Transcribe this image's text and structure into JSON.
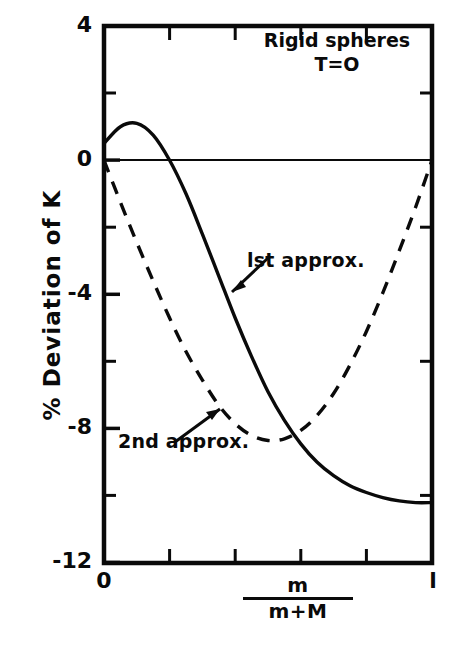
{
  "figure": {
    "background": "#ffffff",
    "ink_color": "#0a0a0a"
  },
  "annotations": {
    "note_line1": "Rigid spheres",
    "note_line2": "T=O",
    "first_approx_label": "lst approx.",
    "second_approx_label": "2nd approx."
  },
  "axes": {
    "ylabel": "% Deviation of K",
    "xlabel_numerator": "m",
    "xlabel_denominator": "m+M",
    "y_tick_labels": [
      "4",
      "0",
      "-4",
      "-8",
      "-12"
    ],
    "y_tick_values": [
      4,
      0,
      -4,
      -8,
      -12
    ],
    "y_minor_values": [
      2,
      -2,
      -6,
      -10
    ],
    "x_tick_labels": [
      "0",
      "l"
    ],
    "x_tick_values": [
      0,
      1
    ],
    "x_minor_values": [
      0.2,
      0.4,
      0.6,
      0.8
    ]
  },
  "chart_data": {
    "type": "line",
    "title": "",
    "subtitle": "Rigid spheres, T=O",
    "xlabel": "m/(m+M)",
    "ylabel": "% Deviation of K",
    "xlim": [
      0,
      1
    ],
    "ylim": [
      -12,
      4
    ],
    "grid": false,
    "legend": "inline-annotations",
    "zero_line": 0,
    "x": [
      0.0,
      0.05,
      0.1,
      0.15,
      0.2,
      0.25,
      0.3,
      0.35,
      0.4,
      0.45,
      0.5,
      0.55,
      0.6,
      0.65,
      0.7,
      0.75,
      0.8,
      0.85,
      0.9,
      0.95,
      1.0
    ],
    "series": [
      {
        "name": "lst approx.",
        "style": "solid",
        "color": "#0a0a0a",
        "values": [
          0.5,
          1.0,
          1.1,
          0.75,
          0.0,
          -1.0,
          -2.2,
          -3.45,
          -4.7,
          -5.85,
          -6.9,
          -7.75,
          -8.45,
          -9.0,
          -9.4,
          -9.7,
          -9.9,
          -10.05,
          -10.15,
          -10.2,
          -10.2
        ]
      },
      {
        "name": "2nd approx.",
        "style": "dashed",
        "color": "#0a0a0a",
        "values": [
          0.0,
          -1.25,
          -2.45,
          -3.6,
          -4.7,
          -5.7,
          -6.55,
          -7.3,
          -7.85,
          -8.2,
          -8.35,
          -8.3,
          -8.05,
          -7.6,
          -6.95,
          -6.1,
          -5.1,
          -3.95,
          -2.7,
          -1.4,
          0.0
        ]
      }
    ]
  }
}
